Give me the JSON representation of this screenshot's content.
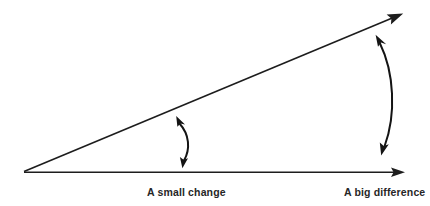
{
  "diagram": {
    "type": "annotated-angle-illustration",
    "background_color": "#ffffff",
    "stroke_color": "#1d1d1d",
    "text_color": "#262626",
    "canvas": {
      "width": 430,
      "height": 206
    },
    "title_text": "",
    "rays": [
      {
        "name": "baseline-ray",
        "label": "horizontal reference ray",
        "from": [
          24,
          172
        ],
        "to": [
          405,
          172
        ],
        "arrowhead": "end"
      },
      {
        "name": "diverging-ray",
        "label": "upward diverging ray",
        "from": [
          24,
          172
        ],
        "to": [
          402,
          14
        ],
        "arrowhead": "end"
      }
    ],
    "vertex": [
      24,
      172
    ],
    "annotations": [
      {
        "name": "small-gap-arc",
        "caption": "A small change",
        "from": [
          178,
          117
        ],
        "to": [
          183,
          167
        ],
        "bulge_x": 192,
        "arrowheads": "both",
        "caption_x": 147,
        "caption_y": 187
      },
      {
        "name": "big-gap-arc",
        "caption": "A big difference",
        "from": [
          377,
          36
        ],
        "to": [
          382,
          154
        ],
        "bulge_x": 396,
        "arrowheads": "both",
        "caption_x": 344,
        "caption_y": 187
      }
    ]
  },
  "labels": {
    "small_change": "A small change",
    "big_difference": "A big difference"
  }
}
